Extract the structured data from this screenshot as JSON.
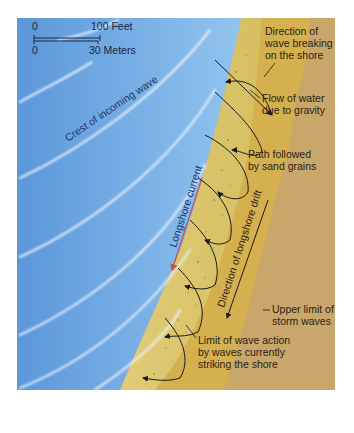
{
  "diagram": {
    "colors": {
      "ocean_dark": "#4f8fd6",
      "ocean_light": "#8cc0ee",
      "wave_crest": "#e8f2fb",
      "swash_sand": "#d9c36a",
      "berm_sand": "#d4b04e",
      "backshore": "#c9a66a",
      "label_text": "#2a2416",
      "ocean_text": "#1c3566",
      "current_arrow": "#c8504a",
      "background": "#ffffff"
    },
    "scale_bar": {
      "feet_zero": "0",
      "feet_max": "100 Feet",
      "meters_zero": "0",
      "meters_max": "30 Meters"
    },
    "labels": {
      "crest": "Crest of incoming wave",
      "longshore_current": "Longshore current",
      "longshore_drift": "Direction of longshore drift",
      "wave_direction_1": "Direction of",
      "wave_direction_2": "wave breaking",
      "wave_direction_3": "on the shore",
      "gravity_1": "Flow of water",
      "gravity_2": "due to gravity",
      "path_1": "Path followed",
      "path_2": "by sand grains",
      "storm_1": "Upper limit of",
      "storm_2": "storm waves",
      "limit_1": "Limit of wave action",
      "limit_2": "by waves currently",
      "limit_3": "striking the shore"
    }
  }
}
